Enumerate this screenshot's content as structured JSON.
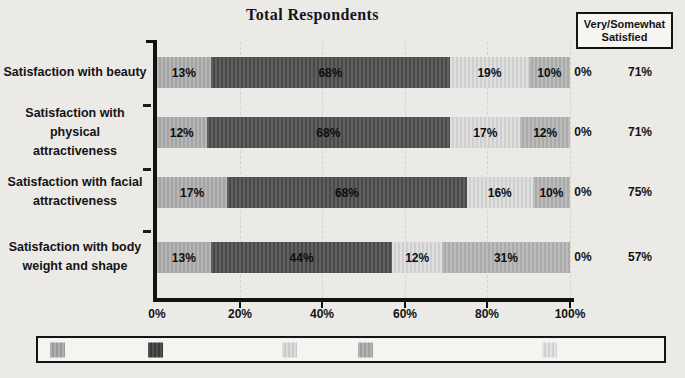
{
  "chart_data": {
    "type": "bar",
    "orientation": "horizontal",
    "stacked": true,
    "title": "Total Respondents",
    "x_axis": {
      "ticks": [
        "0%",
        "20%",
        "40%",
        "60%",
        "80%",
        "100%"
      ],
      "range": [
        0,
        100
      ],
      "gridlines": true
    },
    "segment_colors": [
      "#aeaeae",
      "#4e4e4e",
      "#dcdcdc",
      "#b5b5b5"
    ],
    "rows": [
      {
        "category": "Satisfaction with beauty",
        "category_lines": [
          "Satisfaction with beauty"
        ],
        "segment_labels": [
          "13%",
          "68%",
          "19%",
          "10%"
        ],
        "segment_values": [
          13,
          68,
          19,
          10
        ],
        "display_widths": [
          13,
          58,
          19,
          10
        ],
        "zero_label": "0%",
        "satisfied_label": "71%"
      },
      {
        "category": "Satisfaction with physical attractiveness",
        "category_lines": [
          "Satisfaction with physical",
          "attractiveness"
        ],
        "segment_labels": [
          "12%",
          "68%",
          "17%",
          "12%"
        ],
        "segment_values": [
          12,
          68,
          17,
          12
        ],
        "display_widths": [
          12,
          59,
          17,
          12
        ],
        "zero_label": "0%",
        "satisfied_label": "71%"
      },
      {
        "category": "Satisfaction with facial attractiveness",
        "category_lines": [
          "Satisfaction with facial",
          "attractiveness"
        ],
        "segment_labels": [
          "17%",
          "68%",
          "16%",
          "10%"
        ],
        "segment_values": [
          17,
          68,
          16,
          10
        ],
        "display_widths": [
          17,
          58,
          16,
          9
        ],
        "zero_label": "0%",
        "satisfied_label": "75%"
      },
      {
        "category": "Satisfaction with body weight and shape",
        "category_lines": [
          "Satisfaction with body",
          "weight and shape"
        ],
        "segment_labels": [
          "13%",
          "44%",
          "12%",
          "31%"
        ],
        "segment_values": [
          13,
          44,
          12,
          31
        ],
        "display_widths": [
          13,
          44,
          12,
          31
        ],
        "zero_label": "0%",
        "satisfied_label": "57%"
      }
    ],
    "right_header": {
      "line1": "Very/Somewhat",
      "line2": "Satisfied"
    },
    "very_somewhat_satisfied": [
      "71%",
      "71%",
      "75%",
      "57%"
    ]
  },
  "legend": {
    "swatch_colors": [
      "#a6a6a6",
      "#3d3d3d",
      "#d8d8d8",
      "#ababab",
      "#e0e0e0"
    ],
    "labels": []
  }
}
